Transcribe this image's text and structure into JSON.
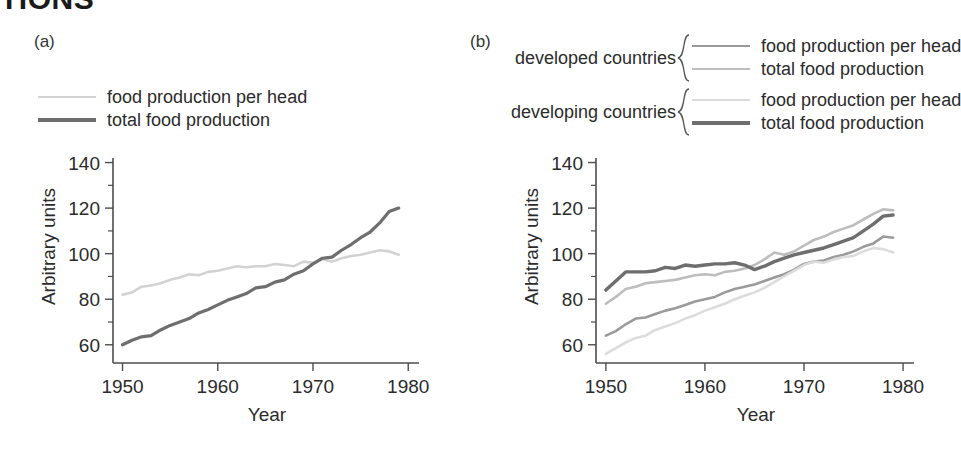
{
  "heading_clipped": "TIONS",
  "panel_a": {
    "label": "(a)",
    "legend": [
      {
        "name": "food production per head",
        "color": "#d2d2d2",
        "width": 2.6
      },
      {
        "name": "total food production",
        "color": "#6e6e6e",
        "width": 3.2
      }
    ]
  },
  "panel_b": {
    "label": "(b)",
    "legend_groups": [
      {
        "group": "developed countries",
        "items": [
          {
            "name": "food production per head",
            "color": "#9a9a9a",
            "width": 2.6
          },
          {
            "name": "total food production",
            "color": "#bdbdbd",
            "width": 2.6
          }
        ]
      },
      {
        "group": "developing countries",
        "items": [
          {
            "name": "food production per head",
            "color": "#dcdcdc",
            "width": 2.6
          },
          {
            "name": "total food production",
            "color": "#6e6e6e",
            "width": 3.4
          }
        ]
      }
    ]
  },
  "chart_data": [
    {
      "type": "line",
      "panel": "(a)",
      "title": "",
      "xlabel": "Year",
      "ylabel": "Arbitrary units",
      "xlim": [
        1949,
        1980.5
      ],
      "ylim": [
        52,
        142
      ],
      "xticks": [
        1950,
        1960,
        1970,
        1980
      ],
      "xticklabels": [
        "1950",
        "1960",
        "1970",
        "1980"
      ],
      "yticks": [
        60,
        80,
        100,
        120,
        140
      ],
      "yticklabels": [
        "60",
        "80",
        "100",
        "120",
        "140"
      ],
      "yminorticks": [
        70,
        90,
        110,
        130
      ],
      "grid": false,
      "legend_position": "above-plot-left",
      "x": [
        1950,
        1951,
        1952,
        1953,
        1954,
        1955,
        1956,
        1957,
        1958,
        1959,
        1960,
        1961,
        1962,
        1963,
        1964,
        1965,
        1966,
        1967,
        1968,
        1969,
        1970,
        1971,
        1972,
        1973,
        1974,
        1975,
        1976,
        1977,
        1978,
        1979
      ],
      "series": [
        {
          "name": "food production per head",
          "color": "#d2d2d2",
          "width": 2.6,
          "values": [
            82,
            83,
            85.5,
            86,
            87,
            88.5,
            89.5,
            91,
            90.5,
            92,
            92.5,
            93.5,
            94.5,
            94,
            94.5,
            94.5,
            95.5,
            95,
            94.5,
            96.5,
            96,
            97.5,
            96.5,
            98,
            99,
            99.5,
            100.5,
            101.5,
            101,
            99.5
          ]
        },
        {
          "name": "total food production",
          "color": "#6e6e6e",
          "width": 3.2,
          "values": [
            60,
            62,
            63.5,
            64,
            66.5,
            68.5,
            70,
            71.5,
            74,
            75.5,
            77.5,
            79.5,
            81,
            82.5,
            85,
            85.5,
            87.5,
            88.5,
            91,
            92.5,
            95.5,
            98,
            98.5,
            101.5,
            104,
            107,
            109.5,
            113.5,
            118.5,
            120
          ]
        }
      ]
    },
    {
      "type": "line",
      "panel": "(b)",
      "title": "",
      "xlabel": "Year",
      "ylabel": "Arbitrary units",
      "xlim": [
        1949,
        1980.5
      ],
      "ylim": [
        52,
        142
      ],
      "xticks": [
        1950,
        1960,
        1970,
        1980
      ],
      "xticklabels": [
        "1950",
        "1960",
        "1970",
        "1980"
      ],
      "yticks": [
        60,
        80,
        100,
        120,
        140
      ],
      "yticklabels": [
        "60",
        "80",
        "100",
        "120",
        "140"
      ],
      "yminorticks": [
        70,
        90,
        110,
        130
      ],
      "grid": false,
      "legend_position": "above-plot",
      "x": [
        1950,
        1951,
        1952,
        1953,
        1954,
        1955,
        1956,
        1957,
        1958,
        1959,
        1960,
        1961,
        1962,
        1963,
        1964,
        1965,
        1966,
        1967,
        1968,
        1969,
        1970,
        1971,
        1972,
        1973,
        1974,
        1975,
        1976,
        1977,
        1978,
        1979
      ],
      "series": [
        {
          "name": "developed countries — total food production",
          "group": "developed countries",
          "label": "total food production",
          "color": "#bdbdbd",
          "width": 2.6,
          "values": [
            78,
            81,
            84.5,
            85.5,
            87,
            87.5,
            88,
            88.5,
            89.5,
            90.5,
            91,
            90.5,
            92,
            92.5,
            93.5,
            95,
            97.5,
            100.5,
            99.5,
            101,
            103.5,
            106,
            107.5,
            109.5,
            111,
            112.5,
            115,
            117.5,
            119.5,
            119
          ]
        },
        {
          "name": "developing countries — total food production",
          "group": "developing countries",
          "label": "total food production",
          "color": "#6e6e6e",
          "width": 3.4,
          "values": [
            84,
            88,
            92,
            92,
            92,
            92.5,
            94,
            93.5,
            95,
            94.5,
            95,
            95.5,
            95.5,
            96,
            95,
            93,
            94.5,
            96.5,
            98,
            99.5,
            100.5,
            101.5,
            102.5,
            104,
            105.5,
            107,
            110,
            113,
            116.5,
            117
          ]
        },
        {
          "name": "developed countries — food production per head",
          "group": "developed countries",
          "label": "food production per head",
          "color": "#9a9a9a",
          "width": 2.6,
          "values": [
            64,
            66,
            69,
            71.5,
            72,
            73.5,
            75,
            76,
            77.5,
            79,
            80,
            81,
            83,
            84.5,
            85.5,
            86.5,
            88,
            89.5,
            91,
            93,
            95.5,
            96.5,
            97,
            98.5,
            99.5,
            101,
            103,
            104.5,
            107.5,
            107
          ]
        },
        {
          "name": "developing countries — food production per head",
          "group": "developing countries",
          "label": "food production per head",
          "color": "#dcdcdc",
          "width": 2.6,
          "values": [
            56,
            58.5,
            61,
            63,
            64,
            66.5,
            68,
            69.5,
            71.5,
            73,
            75,
            76.5,
            78,
            80,
            81.5,
            83,
            85,
            87.5,
            90,
            92.5,
            95,
            96.5,
            96,
            97.5,
            98.5,
            99,
            101,
            102.5,
            102,
            100.5
          ]
        }
      ]
    }
  ]
}
